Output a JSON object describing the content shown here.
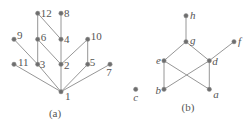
{
  "diagrams": [
    {
      "id": "a",
      "caption": "(a)",
      "label_style": "upright",
      "nodes": [
        {
          "id": "12",
          "label": "12"
        },
        {
          "id": "8",
          "label": "8"
        },
        {
          "id": "9",
          "label": "9"
        },
        {
          "id": "6",
          "label": "6"
        },
        {
          "id": "4",
          "label": "4"
        },
        {
          "id": "10",
          "label": "10"
        },
        {
          "id": "11",
          "label": "11"
        },
        {
          "id": "3",
          "label": "3"
        },
        {
          "id": "2",
          "label": "2"
        },
        {
          "id": "5",
          "label": "5"
        },
        {
          "id": "7",
          "label": "7"
        },
        {
          "id": "1",
          "label": "1"
        }
      ],
      "edges": [
        [
          "12",
          "6"
        ],
        [
          "12",
          "4"
        ],
        [
          "8",
          "4"
        ],
        [
          "9",
          "3"
        ],
        [
          "6",
          "3"
        ],
        [
          "6",
          "2"
        ],
        [
          "4",
          "2"
        ],
        [
          "10",
          "2"
        ],
        [
          "10",
          "5"
        ],
        [
          "11",
          "1"
        ],
        [
          "3",
          "1"
        ],
        [
          "2",
          "1"
        ],
        [
          "5",
          "1"
        ],
        [
          "7",
          "1"
        ]
      ]
    },
    {
      "id": "b",
      "caption": "(b)",
      "label_style": "italic",
      "nodes": [
        {
          "id": "h",
          "label": "h"
        },
        {
          "id": "g",
          "label": "g"
        },
        {
          "id": "f",
          "label": "f"
        },
        {
          "id": "e",
          "label": "e"
        },
        {
          "id": "d",
          "label": "d"
        },
        {
          "id": "c",
          "label": "c"
        },
        {
          "id": "b",
          "label": "b"
        },
        {
          "id": "a",
          "label": "a"
        }
      ],
      "edges": [
        [
          "h",
          "g"
        ],
        [
          "g",
          "e"
        ],
        [
          "g",
          "d"
        ],
        [
          "f",
          "d"
        ],
        [
          "e",
          "b"
        ],
        [
          "e",
          "a"
        ],
        [
          "d",
          "b"
        ],
        [
          "d",
          "a"
        ]
      ]
    }
  ]
}
